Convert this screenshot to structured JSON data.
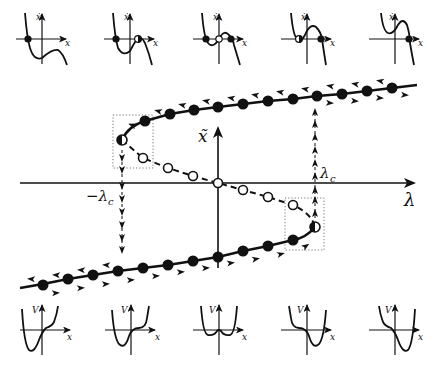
{
  "figure": {
    "type": "bifurcation-diagram",
    "axes": {
      "horizontal_label": "λ",
      "vertical_label": "x̃",
      "x_tick_labels": [
        "−λc",
        "λc"
      ]
    },
    "labels": {
      "minus_lambda_c": "−λ",
      "minus_lambda_c_sub": "c",
      "lambda_c": "λ",
      "lambda_c_sub": "c",
      "lambda_axis": "λ",
      "xtilde_axis": "x̃"
    },
    "branches": [
      {
        "name": "upper-stable",
        "style": "solid",
        "markers": "filled"
      },
      {
        "name": "middle-unstable",
        "style": "dashed",
        "markers": "open"
      },
      {
        "name": "lower-stable",
        "style": "solid",
        "markers": "filled"
      }
    ],
    "fold_points": [
      {
        "name": "left-fold",
        "at": "−λc",
        "marker": "half-filled"
      },
      {
        "name": "right-fold",
        "at": "λc",
        "marker": "half-filled"
      }
    ],
    "jumps": [
      {
        "from": "left-fold",
        "direction": "down",
        "at": "−λc"
      },
      {
        "from": "right-fold",
        "direction": "up",
        "at": "λc"
      }
    ],
    "top_insets": {
      "x_axis_label": "x",
      "y_axis_label": "ẋ",
      "panels": [
        {
          "index": 0,
          "fixed_points": [
            "stable"
          ]
        },
        {
          "index": 1,
          "fixed_points": [
            "stable",
            "half-stable"
          ]
        },
        {
          "index": 2,
          "fixed_points": [
            "stable",
            "unstable",
            "stable"
          ]
        },
        {
          "index": 3,
          "fixed_points": [
            "half-stable",
            "stable"
          ]
        },
        {
          "index": 4,
          "fixed_points": [
            "stable"
          ]
        }
      ]
    },
    "bottom_insets": {
      "x_axis_label": "x",
      "y_axis_label": "V",
      "panels": [
        {
          "index": 0,
          "shape": "single-well-left"
        },
        {
          "index": 1,
          "shape": "well-left-with-inflection"
        },
        {
          "index": 2,
          "shape": "double-well-symmetric"
        },
        {
          "index": 3,
          "shape": "well-right-with-inflection"
        },
        {
          "index": 4,
          "shape": "single-well-right"
        }
      ]
    }
  }
}
